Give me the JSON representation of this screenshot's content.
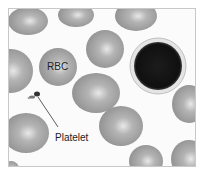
{
  "figure": {
    "labels": {
      "rbc": "RBC",
      "platelet": "Platelet"
    },
    "colors": {
      "background": "#fbfbfb",
      "rbc_fill": "#9a9a9a",
      "rbc_highlight": "#e6e6e6",
      "wbc_nucleus": "#151515",
      "wbc_rim": "#dcdcdc",
      "border": "#c8c8c8"
    }
  }
}
